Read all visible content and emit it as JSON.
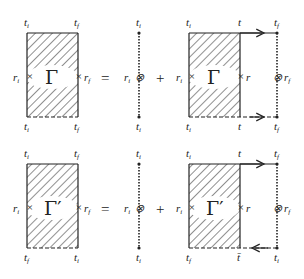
{
  "diagram": {
    "type": "feynman-style equation diagram",
    "rows": [
      {
        "lhs": {
          "symbol": "Γ",
          "top_labels": [
            "t_i",
            "t_f"
          ],
          "bottom_labels": [
            "t_i",
            "t_f"
          ],
          "side_labels": [
            "r_i",
            "r_f"
          ]
        },
        "equals": "=",
        "term1": {
          "top": "t_i",
          "bottom": "t_i",
          "side": "r_i"
        },
        "plus": "+",
        "term2": {
          "symbol": "Γ",
          "top_labels": [
            "t_i",
            "t",
            "t_f"
          ],
          "bottom_labels": [
            "t_i",
            "t",
            "t_f"
          ],
          "side_labels": [
            "r_i",
            "r",
            "r_f"
          ],
          "top_arrow": "right",
          "bottom_arrow": "right"
        }
      },
      {
        "lhs": {
          "symbol": "Γ'",
          "top_labels": [
            "t_i",
            "t_f"
          ],
          "bottom_labels": [
            "t_f",
            "t_i"
          ],
          "side_labels": [
            "r_i",
            "r_f"
          ]
        },
        "equals": "=",
        "term1": {
          "top": "t_i",
          "bottom": "t_i",
          "side": "r_i"
        },
        "plus": "+",
        "term2": {
          "symbol": "Γ'",
          "top_labels": [
            "t_i",
            "t",
            "t_f"
          ],
          "bottom_labels": [
            "t_f",
            "t̄",
            "t_i"
          ],
          "side_labels": [
            "r_i",
            "r",
            "r_f"
          ],
          "top_arrow": "right",
          "bottom_arrow": "left"
        }
      }
    ],
    "text": {
      "gamma": "Γ",
      "gamma_prime": "Γ′",
      "eq": "=",
      "plus": "+",
      "t": "t",
      "r": "r",
      "i": "i",
      "f": "f",
      "tbar": "t̄"
    }
  }
}
